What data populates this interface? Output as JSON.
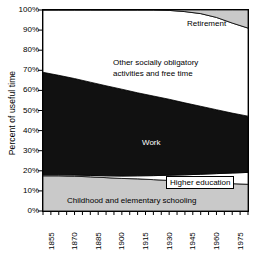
{
  "chart_data": {
    "type": "area",
    "title": "",
    "xlabel": "",
    "ylabel": "Percent of useful time",
    "xlim": [
      1855,
      1985
    ],
    "ylim": [
      0,
      100
    ],
    "grid": false,
    "legend": "inline-annotations",
    "ytick_labels": [
      "100%",
      "90%",
      "80%",
      "70%",
      "60%",
      "50%",
      "40%",
      "30%",
      "20%",
      "10%",
      "0%"
    ],
    "ytick_values": [
      100,
      90,
      80,
      70,
      60,
      50,
      40,
      30,
      20,
      10,
      0
    ],
    "xtick_labels": [
      "1855",
      "1870",
      "1885",
      "1900",
      "1915",
      "1930",
      "1945",
      "1960",
      "1975"
    ],
    "xtick_values": [
      1855,
      1870,
      1885,
      1900,
      1915,
      1930,
      1945,
      1960,
      1975
    ],
    "minor_xtick_interval": 5,
    "stack_order_bottom_to_top": [
      "Childhood and elementary schooling",
      "Higher education",
      "Work",
      "Other socially obligatory activities and free time",
      "Retirement"
    ],
    "x": [
      1855,
      1865,
      1875,
      1885,
      1895,
      1905,
      1915,
      1925,
      1935,
      1945,
      1955,
      1965,
      1975,
      1985
    ],
    "series": [
      {
        "name": "Childhood and elementary schooling",
        "fill": "#c9c9c9",
        "values": [
          17.5,
          17.5,
          17.3,
          17.0,
          16.6,
          16.2,
          16.0,
          15.6,
          15.2,
          14.8,
          14.4,
          14.0,
          13.6,
          13.3
        ]
      },
      {
        "name": "Higher education",
        "fill": "#ffffff",
        "values": [
          0.5,
          0.5,
          0.6,
          0.7,
          0.9,
          1.2,
          1.5,
          2.0,
          2.6,
          3.2,
          3.9,
          4.6,
          5.3,
          5.9
        ]
      },
      {
        "name": "Work",
        "fill": "#111111",
        "values": [
          51.0,
          49.5,
          48.0,
          46.4,
          44.8,
          43.2,
          41.3,
          39.6,
          37.8,
          35.8,
          33.8,
          31.8,
          29.8,
          28.0
        ]
      },
      {
        "name": "Other socially obligatory activities and free time",
        "fill": "#ffffff",
        "values": [
          31.0,
          32.5,
          34.1,
          35.9,
          37.7,
          39.4,
          41.2,
          42.8,
          44.2,
          45.4,
          46.1,
          45.9,
          44.8,
          43.8
        ]
      },
      {
        "name": "Retirement",
        "fill": "#c9c9c9",
        "values": [
          0.0,
          0.0,
          0.0,
          0.0,
          0.0,
          0.0,
          0.0,
          0.0,
          0.2,
          0.8,
          1.8,
          3.7,
          6.5,
          9.0
        ]
      }
    ],
    "annotations": [
      {
        "text": "Retirement",
        "series": "Retirement"
      },
      {
        "text": "Other socially obligatory",
        "series": "Other socially obligatory activities and free time"
      },
      {
        "text": "activities and free time",
        "series": "Other socially obligatory activities and free time"
      },
      {
        "text": "Work",
        "series": "Work"
      },
      {
        "text": "Higher education",
        "series": "Higher education"
      },
      {
        "text": "Childhood and elementary schooling",
        "series": "Childhood and elementary schooling"
      }
    ]
  },
  "axis": {
    "y_title": "Percent of useful time"
  },
  "labels": {
    "retirement": "Retirement",
    "other_line1": "Other socially obligatory",
    "other_line2": "activities and free time",
    "work": "Work",
    "higher_education": "Higher education",
    "childhood": "Childhood and elementary schooling"
  },
  "colors": {
    "band_gray": "#c9c9c9",
    "band_black": "#111111",
    "band_white": "#ffffff",
    "axis": "#000000"
  }
}
